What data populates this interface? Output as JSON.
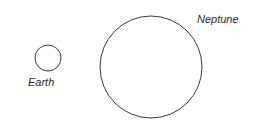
{
  "diagram": {
    "planets": [
      {
        "name": "Earth",
        "label": "Earth"
      },
      {
        "name": "Neptune",
        "label": "Neptune"
      }
    ],
    "colors": {
      "stroke": "#3a3a3a",
      "text": "#2a2a2a",
      "background": "#ffffff"
    }
  }
}
